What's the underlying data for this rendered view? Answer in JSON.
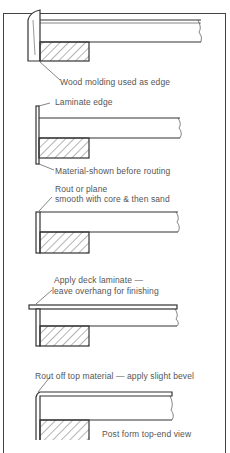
{
  "diagram": {
    "steps": [
      {
        "id": "wood-molding",
        "label": "Wood molding used as edge"
      },
      {
        "id": "laminate-edge",
        "label": "Laminate edge",
        "label2": "Material-shown before routing"
      },
      {
        "id": "rout-plane",
        "label": "Rout or plane",
        "label2": "smooth with core & then sand"
      },
      {
        "id": "deck-laminate",
        "label": "Apply deck laminate —",
        "label2": "leave overhang for finishing"
      },
      {
        "id": "rout-off",
        "label": "Rout off top material — apply slight bevel",
        "label2": "Post form top-end view"
      }
    ],
    "colors": {
      "line": "#333333",
      "text": "#555555",
      "background": "#ffffff"
    }
  }
}
